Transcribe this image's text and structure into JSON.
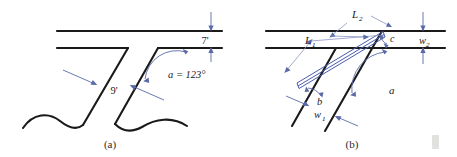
{
  "figure": {
    "title": "",
    "colors": {
      "line": "#1a1a1a",
      "annotation": "#5a6aa8",
      "strip": "#4a5bab",
      "text": "#1a1a1a",
      "artifact": "#c9c9c4"
    },
    "panels": [
      {
        "id": "a",
        "caption": "(a)",
        "labels": {
          "width_top": "7'",
          "width_side": "9'",
          "angle": "a = 123°"
        }
      },
      {
        "id": "b",
        "caption": "(b)",
        "labels": {
          "length_1": "L",
          "length_1_sub": "1",
          "length_2": "L",
          "length_2_sub": "2",
          "width_1": "w",
          "width_1_sub": "1",
          "width_2": "w",
          "width_2_sub": "2",
          "angle_b": "b",
          "angle_c": "c",
          "angle_a": "a"
        }
      }
    ]
  }
}
